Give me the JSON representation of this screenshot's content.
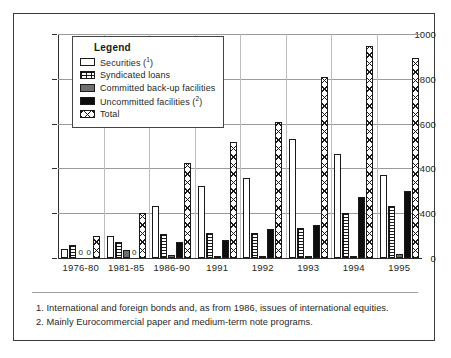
{
  "chart_data": {
    "type": "bar",
    "title": "",
    "xlabel": "",
    "ylabel": "",
    "ylim": [
      0,
      1000
    ],
    "grid": true,
    "legend_position": "inside-top-left",
    "legend_title": "Legend",
    "categories": [
      "1976-80",
      "1981-85",
      "1986-90",
      "1991",
      "1992",
      "1993",
      "1994",
      "1995"
    ],
    "ytick_labels": [
      "1000",
      "800",
      "600",
      "400",
      "400",
      "0"
    ],
    "ytick_values": [
      1000,
      800,
      600,
      400,
      200,
      0
    ],
    "series": [
      {
        "name": "Securities (1)",
        "key": "securities",
        "pattern": "open-white",
        "values": [
          40,
          100,
          232,
          323,
          355,
          530,
          465,
          370
        ]
      },
      {
        "name": "Syndicated loans",
        "key": "syndicated",
        "pattern": "grid-hatch",
        "values": [
          60,
          72,
          105,
          113,
          113,
          135,
          200,
          232
        ]
      },
      {
        "name": "Committed back-up facilities",
        "key": "committed",
        "pattern": "solid-gray",
        "values": [
          0,
          38,
          15,
          5,
          8,
          5,
          10,
          20
        ]
      },
      {
        "name": "Uncommitted facilities (2)",
        "key": "uncommitted",
        "pattern": "solid-black",
        "values": [
          0,
          0,
          72,
          80,
          128,
          148,
          272,
          300
        ]
      },
      {
        "name": "Total",
        "key": "total",
        "pattern": "cross-hatch",
        "values": [
          100,
          200,
          425,
          520,
          605,
          810,
          945,
          895
        ]
      }
    ],
    "zero_markers": [
      {
        "category": "1976-80",
        "series": "committed",
        "label": "0"
      },
      {
        "category": "1976-80",
        "series": "uncommitted",
        "label": "0"
      },
      {
        "category": "1981-85",
        "series": "uncommitted",
        "label": "0"
      }
    ]
  },
  "legend": {
    "title": "Legend",
    "items": [
      {
        "label": "Securities (",
        "sup": "1",
        "tail": ")"
      },
      {
        "label": "Syndicated loans",
        "sup": "",
        "tail": ""
      },
      {
        "label": "Committed back-up facilities",
        "sup": "",
        "tail": ""
      },
      {
        "label": "Uncommitted facilities (",
        "sup": "2",
        "tail": ")"
      },
      {
        "label": "Total",
        "sup": "",
        "tail": ""
      }
    ]
  },
  "footnotes": [
    "1. International and foreign bonds and, as from 1986, issues of international equities.",
    "2. Mainly Eurocommercial paper and medium-term note programs."
  ],
  "colors": {
    "frame": "#3a3a3a",
    "axis": "#2e2e2e",
    "gridline": "#9a9a9a",
    "text": "#1f1f1f",
    "committed_fill": "#6e6e6e",
    "uncommitted_fill": "#0d0d0d",
    "background": "#ffffff"
  }
}
